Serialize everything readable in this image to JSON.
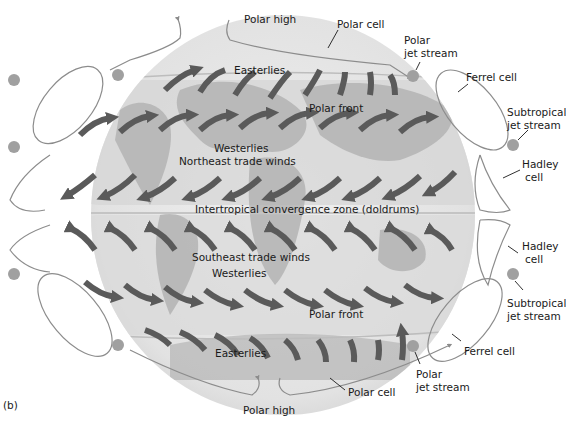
{
  "figure": {
    "panel_label": "(b)",
    "colors": {
      "globe_base": "#e6e6e6",
      "band_mid": "#d2d2d2",
      "land": "#a9a9a9",
      "arrow": "#5a5a5a",
      "cell_line": "#8c8c8c",
      "jet_dot": "#a0a0a0",
      "text": "#1a1a1a"
    }
  },
  "labels": {
    "polar_high_top": "Polar high",
    "polar_cell_top": "Polar cell",
    "polar_jet_top_1": "Polar",
    "polar_jet_top_2": "jet stream",
    "easterlies_top": "Easterlies",
    "ferrel_cell_top": "Ferrel cell",
    "subtropical_jet_top_1": "Subtropical",
    "subtropical_jet_top_2": "jet stream",
    "polar_front_top": "Polar front",
    "westerlies_north": "Westerlies",
    "ne_trade_winds": "Northeast trade winds",
    "hadley_cell_north_1": "Hadley",
    "hadley_cell_north_2": "cell",
    "itcz": "Intertropical convergence zone (doldrums)",
    "hadley_cell_south_1": "Hadley",
    "hadley_cell_south_2": "cell",
    "se_trade_winds": "Southeast trade winds",
    "westerlies_south": "Westerlies",
    "subtropical_jet_bottom_1": "Subtropical",
    "subtropical_jet_bottom_2": "jet stream",
    "polar_front_bottom": "Polar front",
    "ferrel_cell_bottom": "Ferrel cell",
    "easterlies_bottom": "Easterlies",
    "polar_jet_bottom_1": "Polar",
    "polar_jet_bottom_2": "jet stream",
    "polar_cell_bottom": "Polar cell",
    "polar_high_bottom": "Polar high"
  }
}
